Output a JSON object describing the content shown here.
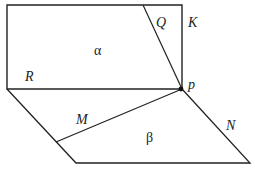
{
  "diagram": {
    "type": "geometry-planes",
    "labels": {
      "plane_alpha": "α",
      "plane_beta": "β",
      "line_R": "R",
      "line_Q": "Q",
      "line_K": "K",
      "line_M": "M",
      "line_N": "N",
      "point_p": "p"
    },
    "stroke_color": "#222222",
    "background": "#ffffff"
  }
}
